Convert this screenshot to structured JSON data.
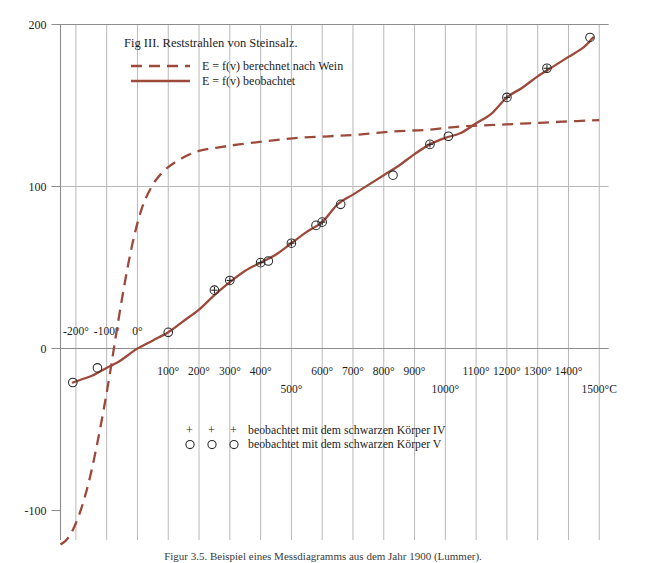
{
  "figure": {
    "title": "Fig III. Reststrahlen von Steinsalz.",
    "caption": "Figur 3.5.  Beispiel eines Messdiagramms aus dem Jahr 1900 (Lummer)."
  },
  "legend": {
    "entries": [
      {
        "label": "E = f(v) berechnet nach Wein",
        "style": "dashed",
        "color": "#9c4a3c"
      },
      {
        "label": "E = f(v) beobachtet",
        "style": "solid",
        "color": "#9c4a3c"
      }
    ]
  },
  "marker_key": [
    {
      "glyph": "+",
      "repeat": 3,
      "label": "beobachtet mit dem schwarzen Körper IV"
    },
    {
      "glyph": "○",
      "repeat": 3,
      "label": "beobachtet mit dem schwarzen Körper V"
    }
  ],
  "axes": {
    "x": {
      "label_suffix": "°C",
      "ticks": [
        {
          "value": -200,
          "label": "-200°",
          "row": 0,
          "position": "above"
        },
        {
          "value": -100,
          "label": "-100°",
          "row": 0,
          "position": "above"
        },
        {
          "value": 0,
          "label": "0°",
          "row": 0,
          "position": "above"
        },
        {
          "value": 100,
          "label": "100°",
          "row": 0,
          "position": "below"
        },
        {
          "value": 200,
          "label": "200°",
          "row": 0,
          "position": "below"
        },
        {
          "value": 300,
          "label": "300°",
          "row": 0,
          "position": "below"
        },
        {
          "value": 400,
          "label": "400°",
          "row": 0,
          "position": "below"
        },
        {
          "value": 500,
          "label": "500°",
          "row": 1,
          "position": "below"
        },
        {
          "value": 600,
          "label": "600°",
          "row": 0,
          "position": "below"
        },
        {
          "value": 700,
          "label": "700°",
          "row": 0,
          "position": "below"
        },
        {
          "value": 800,
          "label": "800°",
          "row": 0,
          "position": "below"
        },
        {
          "value": 900,
          "label": "900°",
          "row": 0,
          "position": "below"
        },
        {
          "value": 1000,
          "label": "1000°",
          "row": 1,
          "position": "below"
        },
        {
          "value": 1100,
          "label": "1100°",
          "row": 0,
          "position": "below"
        },
        {
          "value": 1200,
          "label": "1200°",
          "row": 0,
          "position": "below"
        },
        {
          "value": 1300,
          "label": "1300°",
          "row": 0,
          "position": "below"
        },
        {
          "value": 1400,
          "label": "1400°",
          "row": 0,
          "position": "below"
        },
        {
          "value": 1500,
          "label": "1500°C",
          "row": 1,
          "position": "below"
        }
      ],
      "range": [
        -250,
        1530
      ],
      "gridlines": [
        -200,
        -100,
        0,
        100,
        200,
        300,
        400,
        500,
        600,
        700,
        800,
        900,
        1000,
        1100,
        1200,
        1300,
        1400,
        1500
      ]
    },
    "y": {
      "ticks": [
        {
          "value": 200,
          "label": "200"
        },
        {
          "value": 100,
          "label": "100"
        },
        {
          "value": 0,
          "label": "0"
        },
        {
          "value": -100,
          "label": "-100"
        }
      ],
      "range": [
        -140,
        208
      ],
      "gridlines": [
        200,
        100,
        0
      ]
    }
  },
  "chart_data": {
    "type": "line",
    "title": "Fig III. Reststrahlen von Steinsalz.",
    "xlabel": "Temperatur (°C)",
    "ylabel": "E",
    "xlim": [
      -250,
      1530
    ],
    "ylim": [
      -140,
      208
    ],
    "grid": true,
    "legend_position": "top-left",
    "series": [
      {
        "name": "E = f(v) berechnet nach Wein",
        "style": "dashed",
        "color": "#9c4a3c",
        "points": [
          [
            -250,
            -121
          ],
          [
            -230,
            -118
          ],
          [
            -210,
            -112
          ],
          [
            -190,
            -103
          ],
          [
            -170,
            -91
          ],
          [
            -150,
            -76
          ],
          [
            -130,
            -58
          ],
          [
            -110,
            -38
          ],
          [
            -90,
            -16
          ],
          [
            -70,
            8
          ],
          [
            -50,
            31
          ],
          [
            -30,
            52
          ],
          [
            -10,
            70
          ],
          [
            10,
            84
          ],
          [
            30,
            94
          ],
          [
            60,
            104
          ],
          [
            100,
            112
          ],
          [
            150,
            118
          ],
          [
            200,
            122
          ],
          [
            260,
            124
          ],
          [
            330,
            126
          ],
          [
            420,
            128
          ],
          [
            520,
            130
          ],
          [
            620,
            131
          ],
          [
            720,
            132
          ],
          [
            830,
            134
          ],
          [
            940,
            135
          ],
          [
            1050,
            137
          ],
          [
            1160,
            138
          ],
          [
            1270,
            139
          ],
          [
            1380,
            140
          ],
          [
            1500,
            141
          ]
        ]
      },
      {
        "name": "E = f(v) beobachtet",
        "style": "solid",
        "color": "#9c4a3c",
        "points": [
          [
            -210,
            -21
          ],
          [
            -180,
            -19
          ],
          [
            -150,
            -17
          ],
          [
            -120,
            -14
          ],
          [
            -90,
            -11
          ],
          [
            -60,
            -8
          ],
          [
            -30,
            -4
          ],
          [
            0,
            0
          ],
          [
            50,
            5
          ],
          [
            100,
            10
          ],
          [
            150,
            17
          ],
          [
            200,
            24
          ],
          [
            250,
            33
          ],
          [
            300,
            41
          ],
          [
            350,
            48
          ],
          [
            400,
            53
          ],
          [
            450,
            58
          ],
          [
            500,
            65
          ],
          [
            550,
            72
          ],
          [
            600,
            78
          ],
          [
            650,
            89
          ],
          [
            700,
            95
          ],
          [
            750,
            101
          ],
          [
            800,
            107
          ],
          [
            850,
            113
          ],
          [
            900,
            120
          ],
          [
            950,
            126
          ],
          [
            1000,
            130
          ],
          [
            1050,
            133
          ],
          [
            1100,
            139
          ],
          [
            1150,
            145
          ],
          [
            1200,
            155
          ],
          [
            1250,
            161
          ],
          [
            1300,
            168
          ],
          [
            1350,
            174
          ],
          [
            1400,
            180
          ],
          [
            1450,
            186
          ],
          [
            1480,
            192
          ]
        ]
      }
    ],
    "observations": {
      "name": "beobachtet mit dem schwarzen Körper V",
      "marker": "circle",
      "points": [
        [
          -210,
          -21
        ],
        [
          -130,
          -12
        ],
        [
          100,
          10
        ],
        [
          250,
          36
        ],
        [
          300,
          42
        ],
        [
          400,
          53
        ],
        [
          425,
          54
        ],
        [
          500,
          65
        ],
        [
          580,
          76
        ],
        [
          600,
          78
        ],
        [
          660,
          89
        ],
        [
          830,
          107
        ],
        [
          950,
          126
        ],
        [
          1010,
          131
        ],
        [
          1200,
          155
        ],
        [
          1330,
          173
        ],
        [
          1470,
          192
        ]
      ]
    },
    "observations_iv": {
      "name": "beobachtet mit dem schwarzen Körper IV",
      "marker": "plus",
      "points": [
        [
          250,
          36
        ],
        [
          300,
          42
        ],
        [
          400,
          53
        ],
        [
          500,
          65
        ],
        [
          600,
          78
        ],
        [
          950,
          126
        ],
        [
          1200,
          155
        ],
        [
          1330,
          173
        ]
      ]
    }
  }
}
